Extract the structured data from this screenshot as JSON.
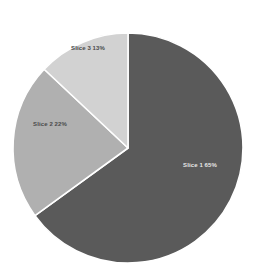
{
  "chart": {
    "title": "",
    "background_color": "#ffffff"
  },
  "chart_data": {
    "type": "pie",
    "title": "",
    "subtitle": "",
    "xlabel": "",
    "ylabel": "",
    "legend_position": "none",
    "grid": false,
    "label_format": "name + percent",
    "start_angle_deg": 0,
    "direction": "clockwise",
    "categories": [
      "Slice 1",
      "Slice 2",
      "Slice 3"
    ],
    "values": [
      65,
      22,
      13
    ],
    "colors": [
      "#5a5a5a",
      "#b0b0b0",
      "#d2d2d2"
    ],
    "slices": [
      {
        "name": "Slice 1",
        "value": 65,
        "percent_text": "65%",
        "color": "#5a5a5a",
        "label_text": "Slice 1 65%",
        "label_on_dark": true
      },
      {
        "name": "Slice 2",
        "value": 22,
        "percent_text": "22%",
        "color": "#b0b0b0",
        "label_text": "Slice 2 22%",
        "label_on_dark": false
      },
      {
        "name": "Slice 3",
        "value": 13,
        "percent_text": "13%",
        "color": "#d2d2d2",
        "label_text": "Slice 3 13%",
        "label_on_dark": false
      }
    ]
  },
  "geometry": {
    "center_x": 128,
    "center_y": 148,
    "radius": 115,
    "separator_color": "#ffffff",
    "separator_width": 1.6
  }
}
